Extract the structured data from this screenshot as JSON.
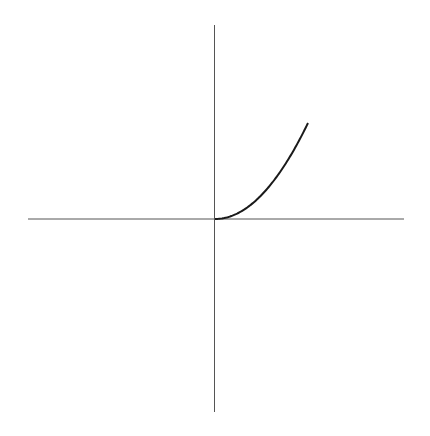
{
  "chart_data": {
    "type": "line",
    "title": "",
    "xlabel": "",
    "ylabel": "",
    "grid": false,
    "legend": null,
    "series": [
      {
        "name": "y = x^2, x >= 0",
        "x": [
          0,
          0.25,
          0.5,
          0.75,
          1.0,
          1.25,
          1.5,
          1.75,
          2.0
        ],
        "y": [
          0,
          0.0625,
          0.25,
          0.5625,
          1.0,
          1.5625,
          2.25,
          3.0625,
          4.0
        ]
      }
    ],
    "xlim": [
      -4.1,
      4.1
    ],
    "ylim": [
      -4.1,
      4.1
    ]
  },
  "colors": {
    "axis": "#555555",
    "curve": "#1a1a1a",
    "background": "#ffffff"
  }
}
